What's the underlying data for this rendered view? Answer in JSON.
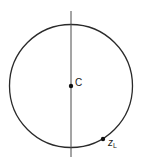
{
  "diagram": {
    "circle": {
      "cx": 71,
      "cy": 86,
      "r": 61.5,
      "stroke": "#2a2a2a"
    },
    "axis_line": {
      "x": 71,
      "y1": 11,
      "y2": 157,
      "stroke": "#4a4a4a"
    },
    "points": [
      {
        "id": "center",
        "label": "C",
        "subscript": "",
        "x": 71,
        "y": 86
      },
      {
        "id": "z-l",
        "label": "z",
        "subscript": "L",
        "x": 103,
        "y": 139
      }
    ]
  }
}
